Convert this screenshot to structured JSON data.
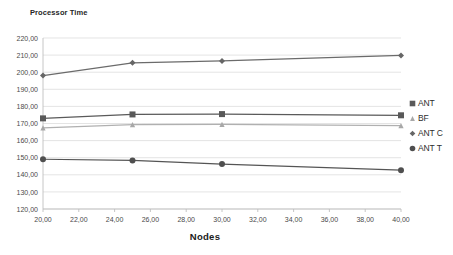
{
  "chart_data": {
    "type": "line",
    "title": "",
    "xlabel": "Nodes",
    "ylabel": "Processor Time",
    "x": [
      20,
      25,
      30,
      40
    ],
    "xlim": [
      20,
      40
    ],
    "ylim": [
      120,
      220
    ],
    "grid": true,
    "legend_position": "right",
    "xtick_labels": [
      "20,00",
      "22,00",
      "24,00",
      "26,00",
      "28,00",
      "30,00",
      "32,00",
      "34,00",
      "36,00",
      "38,00",
      "40,00"
    ],
    "xtick_values": [
      20,
      22,
      24,
      26,
      28,
      30,
      32,
      34,
      36,
      38,
      40
    ],
    "ytick_labels": [
      "120,00",
      "130,00",
      "140,00",
      "150,00",
      "160,00",
      "170,00",
      "180,00",
      "190,00",
      "200,00",
      "210,00",
      "220,00"
    ],
    "ytick_values": [
      120,
      130,
      140,
      150,
      160,
      170,
      180,
      190,
      200,
      210,
      220
    ],
    "series": [
      {
        "name": "ANT",
        "marker": "square",
        "color": "#595959",
        "line_color": "#5a5a5a",
        "values": [
          173.0,
          175.3,
          175.5,
          174.8
        ]
      },
      {
        "name": "BF",
        "marker": "triangle",
        "color": "#a8a8a8",
        "line_color": "#b0b0b0",
        "values": [
          167.4,
          169.4,
          169.5,
          168.8
        ]
      },
      {
        "name": "ANT C",
        "marker": "diamond",
        "color": "#666666",
        "line_color": "#6b6b6b",
        "values": [
          198.0,
          205.5,
          206.6,
          209.8
        ]
      },
      {
        "name": "ANT T",
        "marker": "circle",
        "color": "#4f4f4f",
        "line_color": "#555555",
        "values": [
          149.1,
          148.4,
          146.3,
          142.7
        ]
      }
    ]
  },
  "legend": {
    "items": [
      {
        "label": "ANT",
        "marker": "square",
        "color": "#595959"
      },
      {
        "label": "BF",
        "marker": "triangle",
        "color": "#a8a8a8"
      },
      {
        "label": "ANT C",
        "marker": "diamond",
        "color": "#666666"
      },
      {
        "label": "ANT T",
        "marker": "circle",
        "color": "#4f4f4f"
      }
    ]
  },
  "colors": {
    "background": "#ffffff",
    "gridline": "#d9d9d9",
    "axisline": "#bfbfbf",
    "text": "#3a3a3a"
  }
}
